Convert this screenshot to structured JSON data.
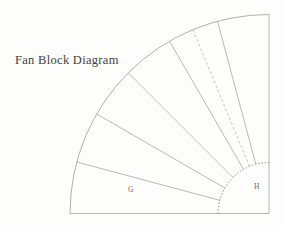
{
  "title": {
    "text": "Fan Block Diagram"
  },
  "diagram": {
    "center": {
      "x": 269,
      "y": 213.5
    },
    "outer_radius": 199,
    "inner_radius": 51,
    "start_angle_deg": 0,
    "end_angle_deg": 90,
    "blade_boundary_angles_deg": [
      15,
      30,
      45,
      60,
      75
    ],
    "dashed_fold_angle_deg": 67.5,
    "blade_count": 6,
    "labels": [
      {
        "text": "G",
        "x": 128,
        "y": 192
      },
      {
        "text": "H",
        "x": 254,
        "y": 189
      }
    ],
    "line_color": "#a6a29a",
    "label_color": "#6e6a62",
    "background_color": "#fdfdfb"
  }
}
